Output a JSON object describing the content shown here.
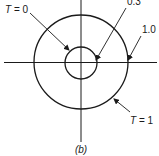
{
  "figure": {
    "caption": "(b)",
    "axes": {
      "center": [
        81,
        62
      ],
      "horizontal": [
        4,
        157
      ],
      "vertical": [
        0,
        142
      ]
    },
    "circles": [
      {
        "name": "inner",
        "value": "0.3",
        "radius": 16
      },
      {
        "name": "outer",
        "value": "1.0",
        "radius": 47
      }
    ],
    "labels": {
      "t0": {
        "T": "T",
        "eq": " = 0",
        "text": "T = 0"
      },
      "r03": {
        "text": "0.3"
      },
      "r10": {
        "text": "1.0"
      },
      "t1": {
        "T": "T",
        "eq": " = 1",
        "text": "T = 1"
      }
    },
    "colors": {
      "ink": "#1a1a1a",
      "background": "#ffffff"
    }
  }
}
